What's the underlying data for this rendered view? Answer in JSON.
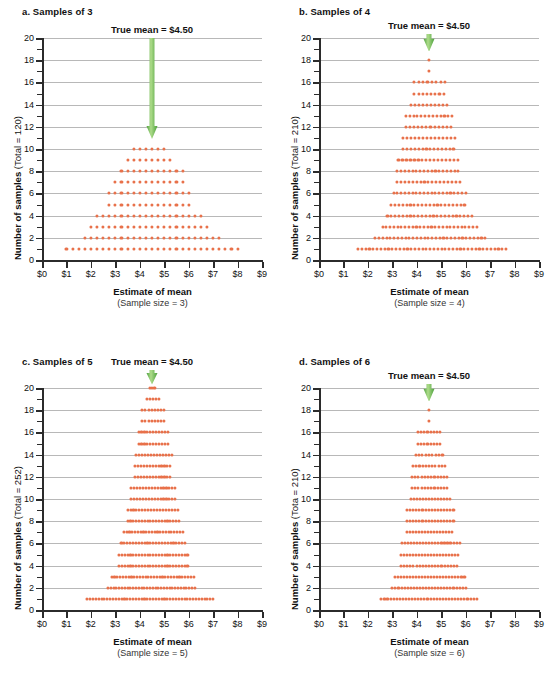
{
  "figure": {
    "accent_dot_color": "#E8714A",
    "arrow_color_light": "#AEDC8A",
    "arrow_color_dark": "#4CA03C",
    "gridline_color": "#b8b8b8",
    "axis_color": "#2b2b2b"
  },
  "chart_data": {
    "type": "scatter",
    "xlabel": "Estimate of mean",
    "ylabel": "Number of samples",
    "xlim": [
      0,
      9
    ],
    "ylim": [
      0,
      20
    ],
    "grid": true,
    "legend": null,
    "x_tick_labels": [
      "$0",
      "$1",
      "$2",
      "$3",
      "$4",
      "$5",
      "$6",
      "$7",
      "$8",
      "$9"
    ],
    "x_tick_values": [
      0,
      1,
      2,
      3,
      4,
      5,
      6,
      7,
      8,
      9
    ],
    "y_tick_labels": [
      "0",
      "2",
      "4",
      "6",
      "8",
      "10",
      "12",
      "14",
      "16",
      "18",
      "20"
    ],
    "y_tick_values": [
      0,
      2,
      4,
      6,
      8,
      10,
      12,
      14,
      16,
      18,
      20
    ],
    "y_minor_ticks": [
      1,
      3,
      5,
      7,
      9,
      11,
      13,
      15,
      17,
      19
    ],
    "annotation": "True mean  =  $4.50",
    "true_mean": 4.5,
    "panels": [
      {
        "id": "a",
        "title": "a. Samples of 3",
        "total_label": "(Total = 120)",
        "total": 120,
        "sample_size": 3,
        "sample_size_label": "(Sample size = 3)",
        "annotation": "True mean  =  $4.50",
        "arrow_top_y": 20,
        "arrow_tip_y": 10.9,
        "dot_step": 0.25,
        "rows": [
          {
            "y": 1,
            "x_start": 1.0,
            "x_end": 8.0,
            "count": 29
          },
          {
            "y": 2,
            "x_start": 1.75,
            "x_end": 7.25,
            "count": 23
          },
          {
            "y": 3,
            "x_start": 2.0,
            "x_end": 6.75,
            "count": 20
          },
          {
            "y": 4,
            "x_start": 2.25,
            "x_end": 6.5,
            "count": 18
          },
          {
            "y": 5,
            "x_start": 2.75,
            "x_end": 6.0,
            "count": 14
          },
          {
            "y": 6,
            "x_start": 2.75,
            "x_end": 6.0,
            "count": 14
          },
          {
            "y": 7,
            "x_start": 3.0,
            "x_end": 5.75,
            "count": 12
          },
          {
            "y": 8,
            "x_start": 3.25,
            "x_end": 5.75,
            "count": 11
          },
          {
            "y": 9,
            "x_start": 3.5,
            "x_end": 5.25,
            "count": 8
          },
          {
            "y": 10,
            "x_start": 3.75,
            "x_end": 5.0,
            "count": 6
          }
        ]
      },
      {
        "id": "b",
        "title": "b. Samples of 4",
        "total_label": "(Total = 210)",
        "total": 210,
        "sample_size": 4,
        "sample_size_label": "(Sample size = 4)",
        "annotation": "True mean  =  $4.50",
        "arrow_top_y": 20.4,
        "arrow_tip_y": 18.8,
        "dot_step": 0.155,
        "rows": [
          {
            "y": 1,
            "x_start": 1.6,
            "x_end": 7.65,
            "count": 40
          },
          {
            "y": 2,
            "x_start": 2.3,
            "x_end": 6.8,
            "count": 30
          },
          {
            "y": 3,
            "x_start": 2.6,
            "x_end": 6.45,
            "count": 26
          },
          {
            "y": 4,
            "x_start": 2.8,
            "x_end": 6.25,
            "count": 23
          },
          {
            "y": 5,
            "x_start": 2.95,
            "x_end": 5.95,
            "count": 20
          },
          {
            "y": 6,
            "x_start": 3.05,
            "x_end": 6.0,
            "count": 20
          },
          {
            "y": 7,
            "x_start": 3.2,
            "x_end": 5.75,
            "count": 17
          },
          {
            "y": 8,
            "x_start": 3.2,
            "x_end": 5.7,
            "count": 17
          },
          {
            "y": 9,
            "x_start": 3.25,
            "x_end": 5.7,
            "count": 16
          },
          {
            "y": 10,
            "x_start": 3.45,
            "x_end": 5.5,
            "count": 14
          },
          {
            "y": 11,
            "x_start": 3.45,
            "x_end": 5.55,
            "count": 14
          },
          {
            "y": 12,
            "x_start": 3.55,
            "x_end": 5.4,
            "count": 12
          },
          {
            "y": 13,
            "x_start": 3.55,
            "x_end": 5.45,
            "count": 13
          },
          {
            "y": 14,
            "x_start": 3.75,
            "x_end": 5.25,
            "count": 10
          },
          {
            "y": 15,
            "x_start": 3.9,
            "x_end": 5.1,
            "count": 8
          },
          {
            "y": 16,
            "x_start": 3.9,
            "x_end": 5.15,
            "count": 8
          },
          {
            "y": 17,
            "x_start": 4.5,
            "x_end": 4.5,
            "count": 1
          },
          {
            "y": 18,
            "x_start": 4.5,
            "x_end": 4.5,
            "count": 1
          }
        ]
      },
      {
        "id": "c",
        "title": "c. Samples of 5",
        "total_label": "(Total = 252)",
        "total": 252,
        "sample_size": 5,
        "sample_size_label": "(Sample size = 5)",
        "annotation": "True mean  =  $4.50",
        "arrow_top_y": 21.6,
        "arrow_tip_y": 20.3,
        "dot_step": 0.115,
        "rows": [
          {
            "y": 1,
            "x_start": 1.85,
            "x_end": 7.0,
            "count": 45
          },
          {
            "y": 2,
            "x_start": 2.7,
            "x_end": 6.25,
            "count": 32
          },
          {
            "y": 3,
            "x_start": 2.85,
            "x_end": 6.2,
            "count": 30
          },
          {
            "y": 4,
            "x_start": 3.15,
            "x_end": 5.95,
            "count": 25
          },
          {
            "y": 5,
            "x_start": 3.15,
            "x_end": 5.95,
            "count": 25
          },
          {
            "y": 6,
            "x_start": 3.25,
            "x_end": 5.85,
            "count": 23
          },
          {
            "y": 7,
            "x_start": 3.35,
            "x_end": 5.75,
            "count": 22
          },
          {
            "y": 8,
            "x_start": 3.5,
            "x_end": 5.6,
            "count": 19
          },
          {
            "y": 9,
            "x_start": 3.5,
            "x_end": 5.55,
            "count": 18
          },
          {
            "y": 10,
            "x_start": 3.65,
            "x_end": 5.45,
            "count": 16
          },
          {
            "y": 11,
            "x_start": 3.65,
            "x_end": 5.45,
            "count": 16
          },
          {
            "y": 12,
            "x_start": 3.8,
            "x_end": 5.25,
            "count": 13
          },
          {
            "y": 13,
            "x_start": 3.8,
            "x_end": 5.25,
            "count": 13
          },
          {
            "y": 14,
            "x_start": 3.85,
            "x_end": 5.3,
            "count": 13
          },
          {
            "y": 15,
            "x_start": 3.95,
            "x_end": 5.15,
            "count": 11
          },
          {
            "y": 16,
            "x_start": 3.95,
            "x_end": 5.15,
            "count": 11
          },
          {
            "y": 17,
            "x_start": 4.1,
            "x_end": 5.0,
            "count": 8
          },
          {
            "y": 18,
            "x_start": 4.1,
            "x_end": 5.0,
            "count": 8
          },
          {
            "y": 19,
            "x_start": 4.3,
            "x_end": 4.8,
            "count": 5
          },
          {
            "y": 20,
            "x_start": 4.4,
            "x_end": 4.6,
            "count": 3
          }
        ]
      },
      {
        "id": "d",
        "title": "d. Samples of 6",
        "total_label": "(Tota = 210)",
        "total": 210,
        "sample_size": 6,
        "sample_size_label": "(Sample size = 6)",
        "annotation": "True mean  =  $4.50",
        "arrow_top_y": 20.4,
        "arrow_tip_y": 18.8,
        "dot_step": 0.125,
        "rows": [
          {
            "y": 1,
            "x_start": 2.55,
            "x_end": 6.45,
            "count": 32
          },
          {
            "y": 2,
            "x_start": 3.0,
            "x_end": 6.0,
            "count": 25
          },
          {
            "y": 3,
            "x_start": 3.1,
            "x_end": 5.95,
            "count": 24
          },
          {
            "y": 4,
            "x_start": 3.35,
            "x_end": 5.65,
            "count": 19
          },
          {
            "y": 5,
            "x_start": 3.35,
            "x_end": 5.7,
            "count": 20
          },
          {
            "y": 6,
            "x_start": 3.4,
            "x_end": 5.75,
            "count": 20
          },
          {
            "y": 7,
            "x_start": 3.6,
            "x_end": 5.45,
            "count": 16
          },
          {
            "y": 8,
            "x_start": 3.6,
            "x_end": 5.5,
            "count": 16
          },
          {
            "y": 9,
            "x_start": 3.6,
            "x_end": 5.5,
            "count": 16
          },
          {
            "y": 10,
            "x_start": 3.75,
            "x_end": 5.35,
            "count": 14
          },
          {
            "y": 11,
            "x_start": 3.8,
            "x_end": 5.25,
            "count": 12
          },
          {
            "y": 12,
            "x_start": 3.8,
            "x_end": 5.25,
            "count": 12
          },
          {
            "y": 13,
            "x_start": 3.85,
            "x_end": 5.15,
            "count": 11
          },
          {
            "y": 14,
            "x_start": 3.95,
            "x_end": 5.05,
            "count": 9
          },
          {
            "y": 15,
            "x_start": 4.05,
            "x_end": 4.95,
            "count": 8
          },
          {
            "y": 16,
            "x_start": 4.05,
            "x_end": 4.95,
            "count": 8
          },
          {
            "y": 17,
            "x_start": 4.5,
            "x_end": 4.5,
            "count": 1
          },
          {
            "y": 18,
            "x_start": 4.5,
            "x_end": 4.5,
            "count": 1
          }
        ]
      }
    ]
  }
}
